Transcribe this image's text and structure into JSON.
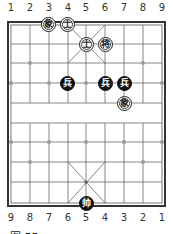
{
  "top_file_numbers": [
    "1",
    "2",
    "3",
    "4",
    "5",
    "6",
    "7",
    "8",
    "9"
  ],
  "bottom_file_numbers": [
    "9",
    "8",
    "7",
    "6",
    "5",
    "4",
    "3",
    "2",
    "1"
  ],
  "caption": "图 55",
  "colors": {
    "line": "#555555",
    "border": "#333333",
    "black_piece": "#111111",
    "red_piece_bg": "#ffffff"
  },
  "pieces": [
    {
      "label": "象",
      "side": "red",
      "col": 2,
      "row": 0
    },
    {
      "label": "士",
      "side": "red",
      "col": 3,
      "row": 0
    },
    {
      "label": "士",
      "side": "red",
      "col": 4,
      "row": 1
    },
    {
      "label": "将",
      "side": "red",
      "col": 5,
      "row": 1
    },
    {
      "label": "兵",
      "side": "black",
      "col": 3,
      "row": 3
    },
    {
      "label": "兵",
      "side": "black",
      "col": 5,
      "row": 3
    },
    {
      "label": "兵",
      "side": "black",
      "col": 6,
      "row": 3
    },
    {
      "label": "象",
      "side": "red",
      "col": 6,
      "row": 4
    },
    {
      "label": "帅",
      "side": "black",
      "col": 4,
      "row": 9
    }
  ]
}
